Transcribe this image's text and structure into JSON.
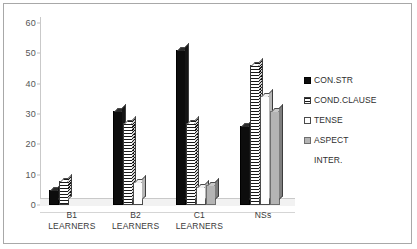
{
  "chart_data": {
    "type": "bar",
    "title": "",
    "subtitle": "",
    "xlabel": "",
    "ylabel": "",
    "ylim": [
      0,
      60
    ],
    "yticks": [
      0,
      10,
      20,
      30,
      40,
      50,
      60
    ],
    "ytick_labels": [
      "0",
      "10",
      "20",
      "30",
      "40",
      "50",
      "60"
    ],
    "grid": false,
    "legend_position": "right",
    "style": "3d-clustered-column",
    "categories": [
      "B1 LEARNERS",
      "B2 LEARNERS",
      "C1 LEARNERS",
      "NSs"
    ],
    "category_lines": [
      [
        "B1",
        "LEARNERS"
      ],
      [
        "B2",
        "LEARNERS"
      ],
      [
        "C1",
        "LEARNERS"
      ],
      [
        "NSs",
        ""
      ]
    ],
    "series": [
      {
        "name": "CON.STR",
        "fill": "solid-black",
        "color": "#0d0d0d",
        "values": [
          5,
          31,
          51,
          26
        ]
      },
      {
        "name": "COND.CLAUSE",
        "fill": "horizontal-stripes",
        "color": "#1a1a1a",
        "values": [
          8,
          27,
          27,
          46
        ]
      },
      {
        "name": "TENSE",
        "fill": "white",
        "color": "#ffffff",
        "values": [
          0,
          7.5,
          6,
          36
        ]
      },
      {
        "name": "ASPECT",
        "fill": "solid-gray",
        "color": "#b4b4b4",
        "values": [
          0,
          0,
          6.5,
          31
        ]
      },
      {
        "name": "INTER.",
        "fill": "none",
        "color": "#ffffff",
        "values": [
          0,
          0,
          0,
          0
        ]
      }
    ]
  },
  "legend": {
    "items": [
      {
        "label": "CON.STR"
      },
      {
        "label": "COND.CLAUSE"
      },
      {
        "label": "TENSE"
      },
      {
        "label": "ASPECT"
      },
      {
        "label": "INTER."
      }
    ]
  }
}
